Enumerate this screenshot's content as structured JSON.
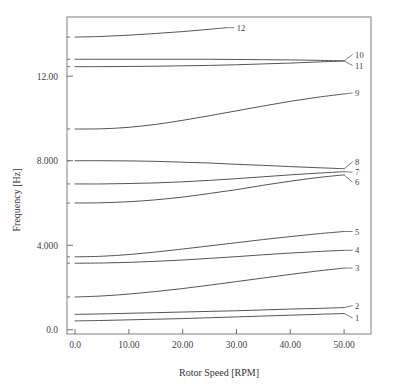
{
  "chart_data": {
    "type": "line",
    "title": "",
    "xlabel": "Rotor Speed [RPM]",
    "ylabel": "Frequency [Hz]",
    "xlim": [
      -1.5,
      55.0
    ],
    "ylim": [
      -0.2,
      14.8
    ],
    "xticks": [
      0,
      10,
      20,
      30,
      40,
      50
    ],
    "xticklabels": [
      "0.0",
      "10.00",
      "20.00",
      "30.00",
      "40.00",
      "50.00"
    ],
    "yticks": [
      0,
      4,
      8,
      12
    ],
    "yticklabels": [
      "0.0",
      "4.000",
      "8.000",
      "12.00"
    ],
    "minor_yticks": [
      1.55,
      3.15,
      3.45,
      6.0,
      6.9,
      8.0,
      9.5,
      12.45,
      12.8,
      13.85
    ],
    "grid": false,
    "legend": "inline-right-labels",
    "line_color": "#555555",
    "frame_color": "#8a8a8a",
    "x": [
      0,
      5,
      10,
      15,
      20,
      25,
      30,
      35,
      40,
      45,
      50
    ],
    "series": [
      {
        "name": "1",
        "label": "1",
        "label_x": 50,
        "values": [
          0.42,
          0.44,
          0.47,
          0.5,
          0.53,
          0.57,
          0.61,
          0.65,
          0.69,
          0.73,
          0.77
        ]
      },
      {
        "name": "2",
        "label": "2",
        "label_x": 50,
        "values": [
          0.73,
          0.75,
          0.78,
          0.81,
          0.84,
          0.87,
          0.9,
          0.94,
          0.98,
          1.01,
          1.05
        ]
      },
      {
        "name": "3",
        "label": "3",
        "label_x": 50,
        "values": [
          1.55,
          1.6,
          1.69,
          1.81,
          1.95,
          2.11,
          2.28,
          2.45,
          2.62,
          2.78,
          2.92
        ]
      },
      {
        "name": "4",
        "label": "4",
        "label_x": 50,
        "values": [
          3.15,
          3.16,
          3.19,
          3.24,
          3.3,
          3.38,
          3.46,
          3.55,
          3.63,
          3.7,
          3.76
        ]
      },
      {
        "name": "5",
        "label": "5",
        "label_x": 50,
        "values": [
          3.45,
          3.48,
          3.56,
          3.68,
          3.82,
          3.97,
          4.12,
          4.27,
          4.41,
          4.54,
          4.65
        ]
      },
      {
        "name": "6",
        "label": "6",
        "label_x": 50,
        "values": [
          6.0,
          6.01,
          6.06,
          6.15,
          6.28,
          6.45,
          6.63,
          6.84,
          7.03,
          7.2,
          7.33
        ]
      },
      {
        "name": "7",
        "label": "7",
        "label_x": 50,
        "values": [
          6.9,
          6.9,
          6.92,
          6.95,
          7.0,
          7.07,
          7.15,
          7.24,
          7.33,
          7.41,
          7.48
        ]
      },
      {
        "name": "8",
        "label": "8",
        "label_x": 50,
        "values": [
          8.0,
          8.0,
          7.99,
          7.97,
          7.93,
          7.89,
          7.83,
          7.78,
          7.72,
          7.67,
          7.62
        ]
      },
      {
        "name": "9",
        "label": "9",
        "label_x": 50,
        "values": [
          9.5,
          9.51,
          9.58,
          9.72,
          9.91,
          10.13,
          10.36,
          10.59,
          10.81,
          11.0,
          11.16
        ]
      },
      {
        "name": "10",
        "label": "10",
        "label_x": 50,
        "values": [
          12.8,
          12.8,
          12.8,
          12.8,
          12.8,
          12.8,
          12.79,
          12.78,
          12.77,
          12.75,
          12.72
        ]
      },
      {
        "name": "11",
        "label": "11",
        "label_x": 50,
        "values": [
          12.45,
          12.45,
          12.46,
          12.47,
          12.49,
          12.51,
          12.54,
          12.58,
          12.62,
          12.67,
          12.72
        ]
      },
      {
        "name": "12",
        "label": "12",
        "label_x": 28,
        "values": [
          13.85,
          13.88,
          13.94,
          14.02,
          14.11,
          14.22,
          14.34,
          14.34,
          14.34,
          14.34,
          14.34
        ]
      }
    ]
  }
}
